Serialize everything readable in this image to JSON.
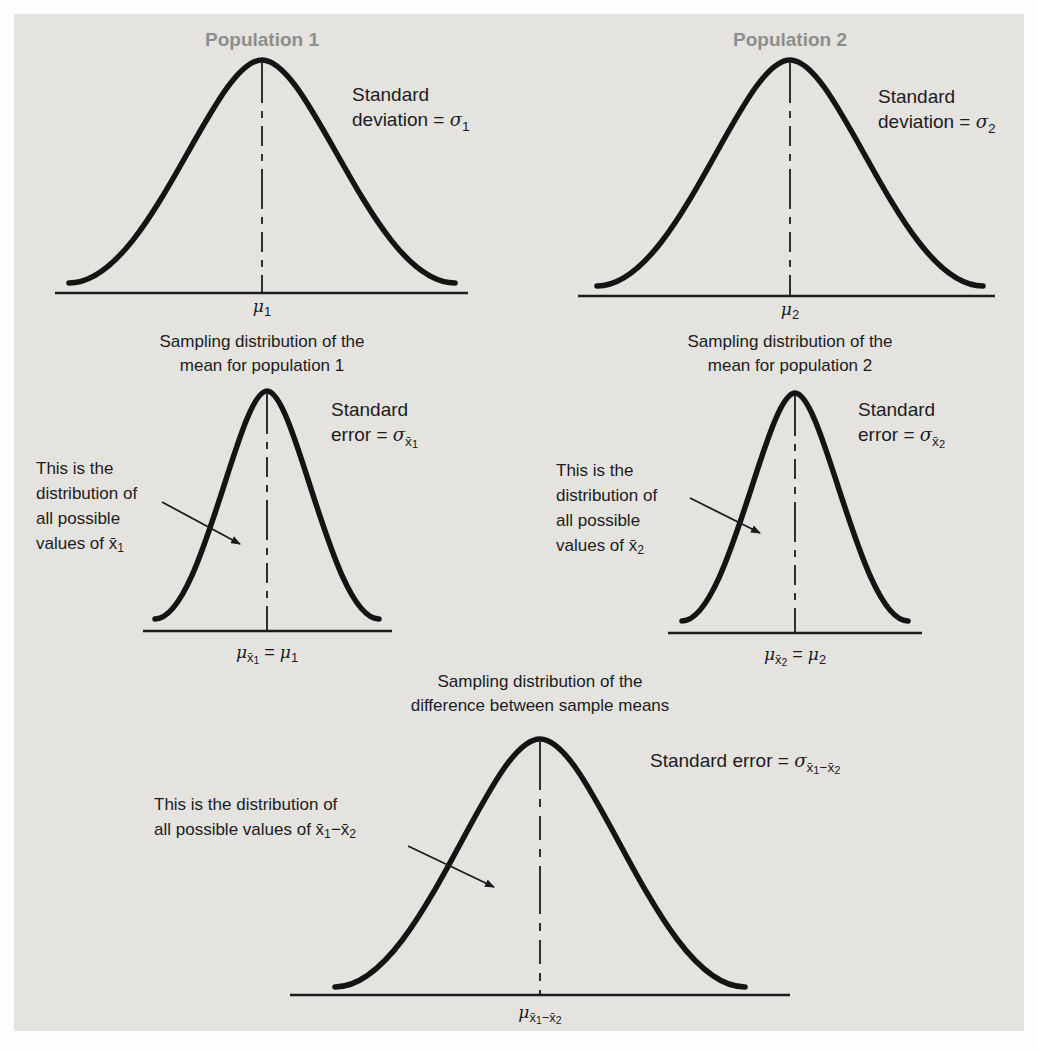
{
  "figure": {
    "population1": {
      "title": "Population 1",
      "std_line1": "Standard",
      "std_line2_prefix": "deviation = ",
      "sigma": "σ",
      "sigma_sub": "1",
      "mu": "μ",
      "mu_sub": "1"
    },
    "population2": {
      "title": "Population 2",
      "std_line1": "Standard",
      "std_line2_prefix": "deviation = ",
      "sigma": "σ",
      "sigma_sub": "2",
      "mu": "μ",
      "mu_sub": "2"
    },
    "sampling1": {
      "title_line1": "Sampling distribution of the",
      "title_line2": "mean for population 1",
      "err_line1": "Standard",
      "err_line2_prefix": "error = ",
      "sigma": "σ",
      "sigma_sub": "x̄",
      "sigma_subsub": "1",
      "annot_line1": "This is the",
      "annot_line2": "distribution of",
      "annot_line3": "all possible",
      "annot_line4_prefix": "values of ",
      "annot_var": "x̄",
      "annot_var_sub": "1",
      "mu": "μ",
      "mu_sub": "x̄",
      "mu_subsub": "1",
      "equals": " = ",
      "mu2": "μ",
      "mu2_sub": "1"
    },
    "sampling2": {
      "title_line1": "Sampling distribution of the",
      "title_line2": "mean for population 2",
      "err_line1": "Standard",
      "err_line2_prefix": "error = ",
      "sigma": "σ",
      "sigma_sub": "x̄",
      "sigma_subsub": "2",
      "annot_line1": "This is the",
      "annot_line2": "distribution of",
      "annot_line3": "all possible",
      "annot_line4_prefix": "values of ",
      "annot_var": "x̄",
      "annot_var_sub": "2",
      "mu": "μ",
      "mu_sub": "x̄",
      "mu_subsub": "2",
      "equals": " = ",
      "mu2": "μ",
      "mu2_sub": "2"
    },
    "difference": {
      "title_line1": "Sampling distribution of the",
      "title_line2": "difference between sample means",
      "err_prefix": "Standard error = ",
      "sigma": "σ",
      "sub1": "x̄",
      "subsub1": "1",
      "sub2": "−x̄",
      "subsub2": "2",
      "annot_line1": "This is the distribution of",
      "annot_line2_prefix": "all possible values of ",
      "v1": "x̄",
      "v1_sub": "1",
      "minus": "−",
      "v2": "x̄",
      "v2_sub": "2",
      "mu": "μ",
      "mu_sub1": "x̄",
      "mu_subsub1": "1",
      "mu_sub2": "−x̄",
      "mu_subsub2": "2"
    }
  },
  "colors": {
    "panel": "#e4e3e0",
    "ink": "#1c1c1c",
    "curve": "#141414",
    "population_title": "#8e8d8b"
  }
}
